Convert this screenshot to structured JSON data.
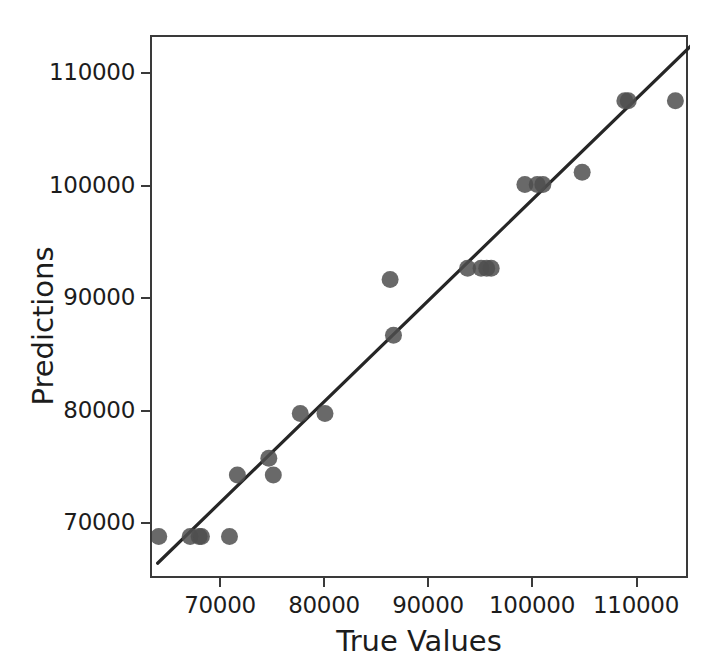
{
  "chart_data": {
    "type": "scatter",
    "title": "",
    "xlabel": "True Values",
    "ylabel": "Predictions",
    "xlim": [
      65300,
      113200
    ],
    "ylim": [
      65100,
      113700
    ],
    "xticks": [
      70000,
      80000,
      90000,
      100000,
      110000
    ],
    "yticks": [
      70000,
      80000,
      90000,
      100000,
      110000
    ],
    "xticklabels": [
      "70000",
      "80000",
      "90000",
      "100000",
      "110000"
    ],
    "yticklabels": [
      "70000",
      "80000",
      "90000",
      "100000",
      "110000"
    ],
    "grid": false,
    "legend": null,
    "marker_color": "#4f4f4f",
    "marker_size": 17,
    "marker_alpha": 0.85,
    "line_color": "#262626",
    "frame_color": "#3a3a3a",
    "series": [
      {
        "name": "predicted vs true",
        "type": "scatter",
        "points": [
          [
            65900,
            69000
          ],
          [
            68700,
            69000
          ],
          [
            69500,
            69000
          ],
          [
            69700,
            69000
          ],
          [
            72200,
            69000
          ],
          [
            72900,
            74500
          ],
          [
            75700,
            76000
          ],
          [
            76100,
            74500
          ],
          [
            78500,
            80000
          ],
          [
            80700,
            80000
          ],
          [
            86500,
            92000
          ],
          [
            86800,
            87000
          ],
          [
            93400,
            93000
          ],
          [
            94600,
            93000
          ],
          [
            95100,
            93000
          ],
          [
            95500,
            93000
          ],
          [
            98500,
            100500
          ],
          [
            99600,
            100500
          ],
          [
            100100,
            100500
          ],
          [
            103600,
            101600
          ],
          [
            107400,
            108000
          ],
          [
            107700,
            108000
          ],
          [
            111900,
            108000
          ]
        ]
      },
      {
        "name": "identity reference line",
        "type": "line",
        "x_start": 65800,
        "y_start": 66600,
        "x_end": 114200,
        "y_end": 113800
      }
    ]
  },
  "axis": {
    "y_label": "Predictions",
    "x_label": "True Values",
    "y_ticks": [
      "110000",
      "100000",
      "90000",
      "80000",
      "70000"
    ],
    "x_ticks": [
      "70000",
      "80000",
      "90000",
      "100000",
      "110000"
    ]
  }
}
